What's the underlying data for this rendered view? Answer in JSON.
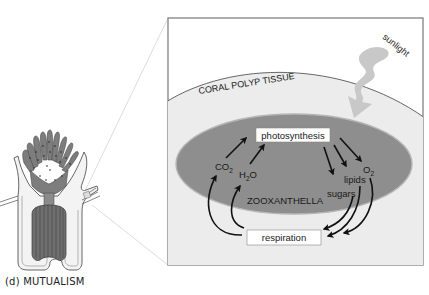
{
  "figure": {
    "caption": "(d) MUTUALISM",
    "inset": {
      "tissue_label": "CORAL POLYP TISSUE",
      "light_label": "sunlight",
      "organism_label": "ZOOXANTHELLA",
      "process_top": "photosynthesis",
      "process_bottom": "respiration",
      "inputs": [
        {
          "base": "CO",
          "sub": "2"
        },
        {
          "base": "H",
          "sub": "2",
          "tail": "O"
        }
      ],
      "outputs": [
        {
          "base": "O",
          "sub": "2"
        },
        {
          "label": "lipids"
        },
        {
          "label": "sugars"
        }
      ]
    },
    "colors": {
      "panel_bg": "#ffffff",
      "panel_border": "#8a8a8a",
      "tissue_fill": "#ececec",
      "zooxanthella_fill": "#8e8e8e",
      "zooxanthella_edge": "#b0b0b0",
      "sunlight": "#c8c8c8",
      "arrow": "#111111",
      "label_box": "#ffffff"
    }
  }
}
